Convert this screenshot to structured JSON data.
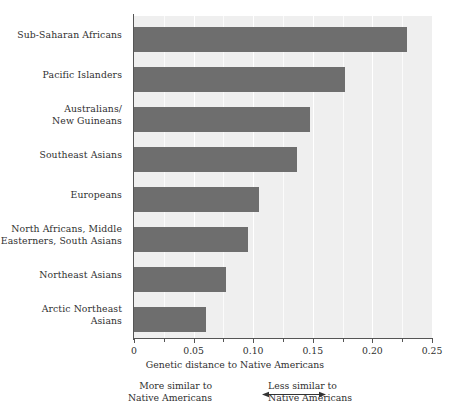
{
  "chart_data": {
    "type": "bar",
    "orientation": "horizontal",
    "title": "",
    "xlabel": "Genetic distance to Native Americans",
    "ylabel": "",
    "xlim": [
      0,
      0.25
    ],
    "ylim": null,
    "grid": true,
    "grid_axis": "x",
    "legend": null,
    "bar_color": "#6e6e6e",
    "plot_background": "#efefef",
    "categories": [
      "Sub-Saharan Africans",
      "Pacific Islanders",
      "Australians/\nNew Guineans",
      "Southeast Asians",
      "Europeans",
      "North Africans, Middle\nEasterners, South Asians",
      "Northeast Asians",
      "Arctic Northeast\nAsians"
    ],
    "values": [
      0.229,
      0.177,
      0.148,
      0.137,
      0.105,
      0.096,
      0.077,
      0.06
    ],
    "xticks": [
      0,
      0.05,
      0.1,
      0.15,
      0.2,
      0.25
    ],
    "xticklabels": [
      "0",
      "0.05",
      "0.10",
      "0.15",
      "0.20",
      "0.25"
    ],
    "xminorticks": [
      0.025,
      0.075,
      0.125,
      0.175,
      0.225
    ],
    "annotations": [
      {
        "id": "more-similar",
        "text": "More similar to\nNative Americans",
        "position": "bottom-left-of-arrow"
      },
      {
        "id": "less-similar",
        "text": "Less similar to\nNative Americans",
        "position": "bottom-right-of-arrow"
      },
      {
        "id": "double-arrow",
        "text": "",
        "position": "bottom-center"
      }
    ]
  }
}
